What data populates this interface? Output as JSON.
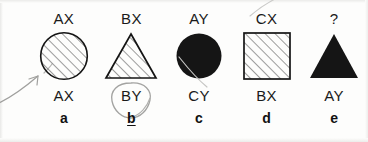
{
  "document": {
    "kind": "scanned-multiple-choice-question",
    "selected_answer": "b"
  },
  "options": [
    {
      "letter": "a",
      "label_top": "AX",
      "label_bottom": "AX",
      "shape": "circle",
      "fill": "hatched",
      "marked": false
    },
    {
      "letter": "b",
      "label_top": "BX",
      "label_bottom": "BY",
      "shape": "triangle",
      "fill": "hatched",
      "marked": true
    },
    {
      "letter": "c",
      "label_top": "AY",
      "label_bottom": "CY",
      "shape": "circle",
      "fill": "solid",
      "marked": false
    },
    {
      "letter": "d",
      "label_top": "CX",
      "label_bottom": "BX",
      "shape": "square",
      "fill": "hatched",
      "marked": false
    },
    {
      "letter": "e",
      "label_top": "?",
      "label_bottom": "AY",
      "shape": "triangle",
      "fill": "solid",
      "marked": false
    }
  ],
  "annotations": {
    "arrow": "hand-drawn pencil arrow pointing to option a",
    "loop": "hand-drawn pencil circle around BY",
    "underline": "hand-drawn underline beneath b"
  },
  "colors": {
    "ink": "#1a1a1a",
    "paper": "#fdfdfc",
    "pencil": "#9a9a98",
    "hatch": "#555555",
    "solid_fill": "#151515"
  }
}
